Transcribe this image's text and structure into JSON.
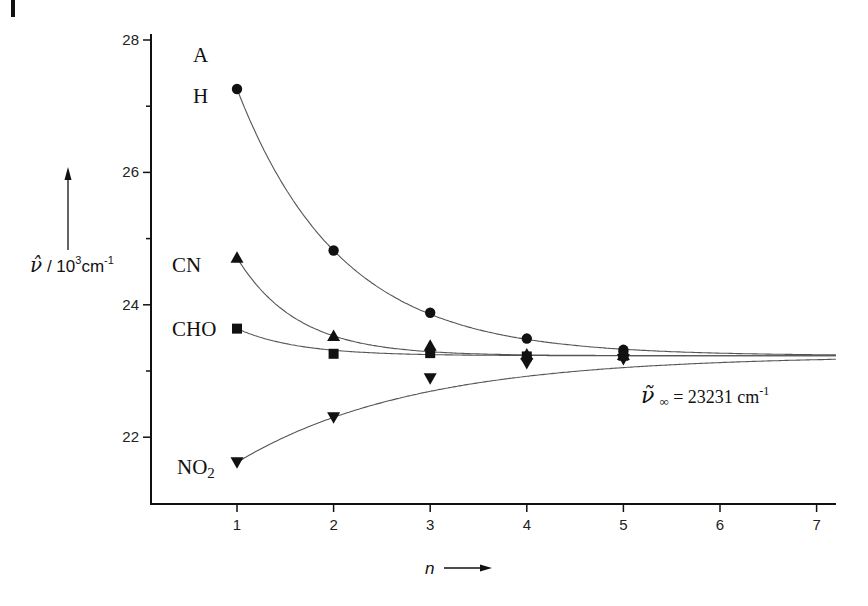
{
  "chart_data": {
    "type": "scatter",
    "title": "",
    "xlabel": "n",
    "ylabel": "ν̃ / 10³cm⁻¹",
    "xlim": [
      0.0,
      7.2
    ],
    "ylim": [
      21.0,
      28.0
    ],
    "x_ticks": [
      1,
      2,
      3,
      4,
      5,
      6,
      7
    ],
    "y_ticks": [
      22,
      24,
      26,
      28
    ],
    "y_minor_ticks": [
      23,
      25,
      27
    ],
    "grid": false,
    "panel_label": "A",
    "asymptote": {
      "value": 23.231,
      "label_symbol": "ν̃",
      "label_sub": "∞",
      "label_text": " = 23231 cm",
      "label_sup": "-1"
    },
    "series": [
      {
        "name": "H",
        "marker": "circle",
        "x": [
          1,
          2,
          3,
          4,
          5
        ],
        "values": [
          27.26,
          24.82,
          23.88,
          23.49,
          23.32
        ]
      },
      {
        "name": "CN",
        "marker": "triangle-up",
        "x": [
          1,
          2,
          3,
          4,
          5
        ],
        "values": [
          24.71,
          23.53,
          23.38,
          23.25,
          23.24
        ]
      },
      {
        "name": "CHO",
        "marker": "square",
        "x": [
          1,
          2,
          3,
          4,
          5
        ],
        "values": [
          23.64,
          23.26,
          23.27,
          23.22,
          23.23
        ]
      },
      {
        "name": "NO2",
        "marker": "triangle-down",
        "x": [
          1,
          2,
          3,
          4,
          5
        ],
        "values": [
          21.62,
          22.3,
          22.89,
          23.12,
          23.18
        ]
      }
    ]
  },
  "labels": {
    "panel": "A",
    "series_H": "H",
    "series_CN": "CN",
    "series_CHO": "CHO",
    "series_NO2_main": "NO",
    "series_NO2_sub": "2",
    "y_axis_symbol": "ν̂",
    "y_axis_unit": " / 10",
    "y_axis_sup": "3",
    "y_axis_cm": "cm",
    "y_axis_cm_sup": "-1",
    "x_axis_title": "n",
    "asym_symbol": "ν̃",
    "asym_sub": "∞",
    "asym_text": " = 23231 cm",
    "asym_sup": "-1"
  }
}
